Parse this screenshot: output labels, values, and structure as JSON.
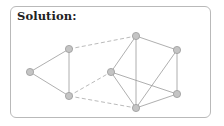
{
  "title": "Solution:",
  "colors": {
    "node_fill": "#c4c4c4",
    "node_stroke": "#9a9a9a",
    "edge_solid": "#9a9a9a",
    "edge_dashed": "#a8a8a8",
    "frame_border": "#b9b9b9"
  },
  "graph": {
    "nodes": [
      {
        "id": "A",
        "group": "left"
      },
      {
        "id": "B",
        "group": "left"
      },
      {
        "id": "C",
        "group": "left"
      },
      {
        "id": "D",
        "group": "right"
      },
      {
        "id": "E",
        "group": "right"
      },
      {
        "id": "F",
        "group": "right"
      },
      {
        "id": "G",
        "group": "right"
      },
      {
        "id": "H",
        "group": "right"
      }
    ],
    "edges": [
      {
        "from": "A",
        "to": "B",
        "style": "solid"
      },
      {
        "from": "A",
        "to": "C",
        "style": "solid"
      },
      {
        "from": "B",
        "to": "C",
        "style": "solid"
      },
      {
        "from": "B",
        "to": "D",
        "style": "dashed"
      },
      {
        "from": "C",
        "to": "F",
        "style": "dashed"
      },
      {
        "from": "C",
        "to": "H",
        "style": "dashed"
      },
      {
        "from": "D",
        "to": "E",
        "style": "solid"
      },
      {
        "from": "D",
        "to": "F",
        "style": "solid"
      },
      {
        "from": "D",
        "to": "H",
        "style": "solid"
      },
      {
        "from": "E",
        "to": "G",
        "style": "solid"
      },
      {
        "from": "E",
        "to": "H",
        "style": "solid"
      },
      {
        "from": "F",
        "to": "G",
        "style": "solid"
      },
      {
        "from": "F",
        "to": "H",
        "style": "solid"
      },
      {
        "from": "G",
        "to": "H",
        "style": "solid"
      }
    ]
  }
}
